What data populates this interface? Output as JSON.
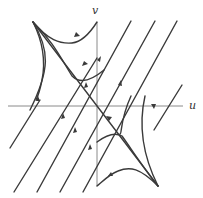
{
  "diagram": {
    "type": "phase-portrait",
    "axes": {
      "horizontal_label": "u",
      "vertical_label": "v"
    },
    "equilibrium": "saddle at origin",
    "colors": {
      "axis": "#8a8a8a",
      "trajectory": "#3a3a3a",
      "background": "#ffffff"
    }
  }
}
